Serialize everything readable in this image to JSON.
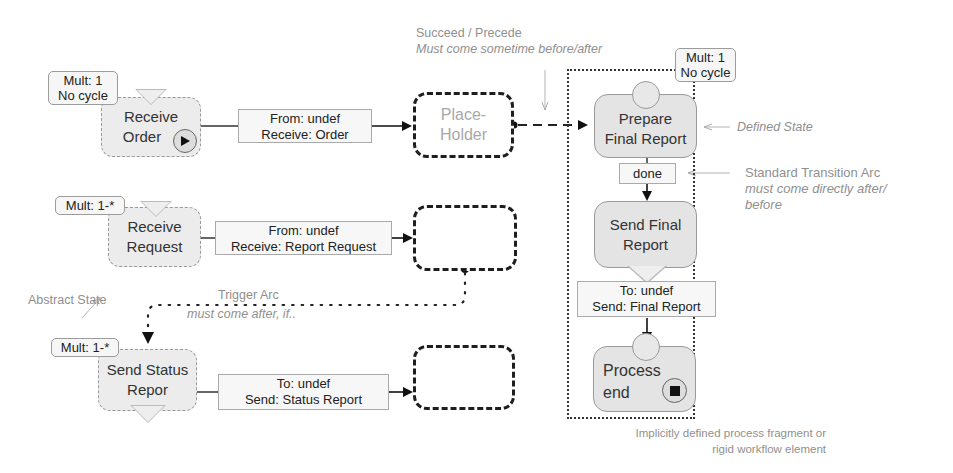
{
  "annotations": {
    "succeed_precede": {
      "title": "Succeed / Precede",
      "subtitle": "Must come sometime before/after"
    },
    "defined_state": "Defined State",
    "standard_transition": {
      "title": "Standard Transition Arc",
      "subtitle_line1": "must come directly after/",
      "subtitle_line2": "before"
    },
    "abstract_state": "Abstract State",
    "trigger_arc": {
      "title": "Trigger Arc",
      "subtitle": "must come after, if.."
    },
    "fragment_note": {
      "line1": "Implicitly defined process fragment or",
      "line2": "rigid workflow element"
    }
  },
  "left_states": [
    {
      "id": "receive-order",
      "line1": "Receive",
      "line2": "Order",
      "mult_line1": "Mult: 1",
      "mult_line2": "No cycle",
      "icon": "play-icon"
    },
    {
      "id": "receive-request",
      "line1": "Receive",
      "line2": "Request",
      "mult_line1": "Mult: 1-*",
      "mult_line2": ""
    },
    {
      "id": "send-status-report",
      "line1": "Send Status",
      "line2": "Repor",
      "mult_line1": "Mult: 1-*",
      "mult_line2": ""
    }
  ],
  "messages": [
    {
      "line1": "From: undef",
      "line2": "Receive: Order"
    },
    {
      "line1": "From: undef",
      "line2": "Receive: Report Request"
    },
    {
      "line1": "To: undef",
      "line2": "Send: Status Report"
    }
  ],
  "placeholders": [
    {
      "line1": "Place-",
      "line2": "Holder"
    },
    {
      "line1": "",
      "line2": ""
    },
    {
      "line1": "",
      "line2": ""
    }
  ],
  "fragment": {
    "mult_line1": "Mult: 1",
    "mult_line2": "No cycle",
    "states": [
      {
        "line1": "Prepare",
        "line2": "Final Report"
      },
      {
        "line1": "Send Final",
        "line2": "Report"
      },
      {
        "line1": "Process",
        "line2": "end",
        "icon": "stop-icon"
      }
    ],
    "transition_label": "done",
    "send_message": {
      "line1": "To: undef",
      "line2": "Send: Final Report"
    }
  }
}
